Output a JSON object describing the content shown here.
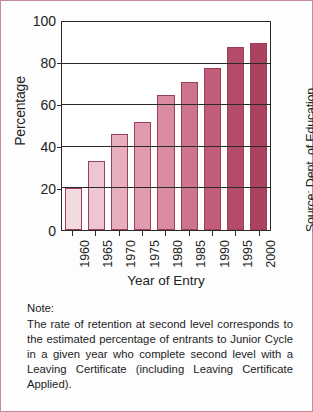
{
  "figure": {
    "border_color": "#c88b9c",
    "background": "#fdfdfd"
  },
  "axis": {
    "y_title": "Percentage",
    "x_title": "Year of Entry",
    "source": "Source: Dept. of Education"
  },
  "note": {
    "heading": "Note:",
    "body": "The rate of retention at second level corresponds to the estimated percentage of entrants to Junior Cycle in a given year who complete second level with a Leaving Certificate (including Leaving Certificate Applied)."
  },
  "chart_data": {
    "type": "bar",
    "title": "",
    "xlabel": "Year of Entry",
    "ylabel": "Percentage",
    "ylim": [
      0,
      100
    ],
    "yticks": [
      0,
      20,
      40,
      60,
      80,
      100
    ],
    "grid": true,
    "legend": "none",
    "categories": [
      "1960",
      "1965",
      "1970",
      "1975",
      "1980",
      "1985",
      "1990",
      "1995",
      "2000"
    ],
    "values": [
      20,
      33,
      46,
      52,
      65,
      71,
      78,
      88,
      90
    ],
    "bar_colors": [
      "#f2dae1",
      "#eec6d1",
      "#e7afbe",
      "#e09cae",
      "#d98ba0",
      "#cf748d",
      "#c25e79",
      "#b24c68",
      "#ab4360"
    ],
    "bar_border_color": "#9c4059",
    "axis_color": "#2a2a2a",
    "source": "Source: Dept. of Education"
  }
}
